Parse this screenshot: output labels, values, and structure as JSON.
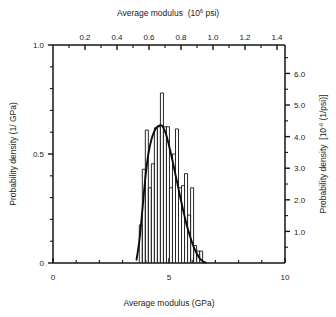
{
  "chart_data": {
    "type": "bar",
    "title": "",
    "xlabel": "Average modulus (GPa)",
    "ylabel": "Probability density (1/GPa)",
    "xlabel_top": "Average modulus  (10⁶ psi)",
    "ylabel_right": "Probability density  [10⁻⁶ (1/psi)]",
    "xlim": [
      0,
      10
    ],
    "ylim": [
      0,
      1.0
    ],
    "xlim_top": [
      0,
      1.45
    ],
    "ylim_right": [
      0,
      6.9
    ],
    "grid": false,
    "legend": null,
    "axis_bottom": {
      "label": "Average modulus (GPa)",
      "ticks": [
        0,
        5,
        10
      ],
      "tick_labels": [
        "0",
        "5",
        "10"
      ],
      "minor_step": 1
    },
    "axis_top": {
      "label_main": "Average modulus",
      "label_unit": "(10",
      "label_unit_sup": "6",
      "label_unit_end": " psi)",
      "ticks": [
        0.2,
        0.4,
        0.6,
        0.8,
        1.0,
        1.2,
        1.4
      ],
      "tick_labels": [
        "0.2",
        "0.4",
        "0.6",
        "0.8",
        "1.0",
        "1.2",
        "1.4"
      ],
      "minor_step": 0.1
    },
    "axis_left": {
      "label": "Probability density (1/ GPa)",
      "ticks": [
        0,
        0.5,
        1.0
      ],
      "tick_labels": [
        "0",
        "0.5",
        "1.0"
      ],
      "minor_step": 0.1
    },
    "axis_right": {
      "label_main": "Probability density",
      "label_unit": "[10",
      "label_unit_sup": "-6",
      "label_unit_end": " (1/psi)]",
      "ticks": [
        1.0,
        2.0,
        3.0,
        4.0,
        5.0,
        6.0
      ],
      "tick_labels": [
        "1.0",
        "2.0",
        "3.0",
        "4.0",
        "5.0",
        "6.0"
      ],
      "minor_step": 0.5
    },
    "bin_edges_gpa": [
      3.72,
      3.85,
      3.98,
      4.11,
      4.24,
      4.37,
      4.5,
      4.63,
      4.76,
      4.89,
      5.02,
      5.15,
      5.28,
      5.41,
      5.54,
      5.67,
      5.8,
      5.93,
      6.06,
      6.19,
      6.32,
      6.45
    ],
    "values": [
      0.175,
      0.43,
      0.61,
      0.345,
      0.455,
      0.62,
      0.625,
      0.78,
      0.625,
      0.625,
      0.345,
      0.5,
      0.615,
      0.345,
      0.355,
      0.41,
      0.22,
      0.345,
      0.08,
      0.055,
      0.055
    ],
    "categories": [
      "3.78",
      "3.91",
      "4.04",
      "4.17",
      "4.30",
      "4.43",
      "4.56",
      "4.69",
      "4.82",
      "4.95",
      "5.08",
      "5.21",
      "5.34",
      "5.47",
      "5.60",
      "5.73",
      "5.86",
      "5.99",
      "6.12",
      "6.25",
      "6.38"
    ],
    "fit_curve": {
      "name": "fitted distribution",
      "x": [
        3.6,
        3.72,
        3.85,
        3.98,
        4.11,
        4.24,
        4.37,
        4.5,
        4.63,
        4.7,
        4.76,
        4.89,
        5.02,
        5.15,
        5.28,
        5.41,
        5.54,
        5.67,
        5.8,
        5.93,
        6.06,
        6.19,
        6.32,
        6.45,
        6.58
      ],
      "y": [
        0.015,
        0.1,
        0.24,
        0.39,
        0.5,
        0.565,
        0.605,
        0.625,
        0.632,
        0.63,
        0.62,
        0.585,
        0.53,
        0.47,
        0.405,
        0.34,
        0.275,
        0.215,
        0.16,
        0.115,
        0.075,
        0.045,
        0.022,
        0.008,
        0.002
      ]
    }
  },
  "colors": {
    "axis": "#141414",
    "bar_stroke": "#2a2a2a",
    "bar_fill": "#ffffff",
    "curve": "#0d0d0d",
    "background": "#ffffff"
  }
}
